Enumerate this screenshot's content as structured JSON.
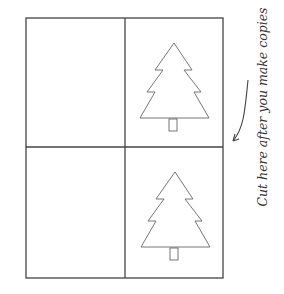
{
  "card": {
    "panels": [
      {
        "position": "top-left",
        "content": "blank"
      },
      {
        "position": "top-right",
        "content": "tree-icon"
      },
      {
        "position": "bottom-left",
        "content": "blank"
      },
      {
        "position": "bottom-right",
        "content": "tree-icon"
      }
    ],
    "line_color": "#444444"
  },
  "annotation": {
    "text": "Cut here after you make copies",
    "arrow_icon": "curved-arrow-icon"
  }
}
